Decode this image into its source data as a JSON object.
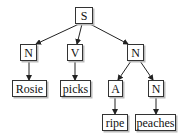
{
  "tree": {
    "nodes": [
      {
        "id": "s",
        "label": "S",
        "x": 75,
        "y": 7,
        "w": 18
      },
      {
        "id": "n1",
        "label": "N",
        "x": 20,
        "y": 44,
        "w": 17
      },
      {
        "id": "v",
        "label": "V",
        "x": 67,
        "y": 44,
        "w": 16
      },
      {
        "id": "n2",
        "label": "N",
        "x": 127,
        "y": 44,
        "w": 17
      },
      {
        "id": "rosie",
        "label": "Rosie",
        "x": 12,
        "y": 80,
        "w": 35
      },
      {
        "id": "picks",
        "label": "picks",
        "x": 60,
        "y": 80,
        "w": 31
      },
      {
        "id": "a",
        "label": "A",
        "x": 108,
        "y": 80,
        "w": 15
      },
      {
        "id": "n3",
        "label": "N",
        "x": 148,
        "y": 80,
        "w": 16
      },
      {
        "id": "ripe",
        "label": "ripe",
        "x": 102,
        "y": 114,
        "w": 26
      },
      {
        "id": "peaches",
        "label": "peaches",
        "x": 135,
        "y": 114,
        "w": 41
      }
    ],
    "edges": [
      [
        "s",
        "n1"
      ],
      [
        "s",
        "v"
      ],
      [
        "s",
        "n2"
      ],
      [
        "n1",
        "rosie"
      ],
      [
        "v",
        "picks"
      ],
      [
        "n2",
        "a"
      ],
      [
        "n2",
        "n3"
      ],
      [
        "a",
        "ripe"
      ],
      [
        "n3",
        "peaches"
      ]
    ]
  }
}
